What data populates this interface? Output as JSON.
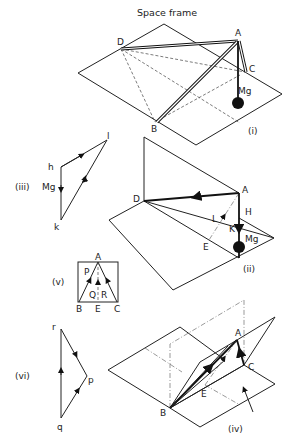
{
  "title": "Space frame",
  "figures": {
    "i": {
      "label": "(i)",
      "points": {
        "A": "A",
        "B": "B",
        "C": "C",
        "D": "D"
      },
      "load": "Mg"
    },
    "ii": {
      "label": "(ii)",
      "points": {
        "A": "A",
        "D": "D",
        "E": "E"
      },
      "forces": {
        "H": "H",
        "K": "K",
        "L": "L"
      },
      "load": "Mg"
    },
    "iii": {
      "label": "(iii)",
      "vertices": {
        "h": "h",
        "k": "k",
        "l": "l"
      },
      "load": "Mg"
    },
    "iv": {
      "label": "(iv)",
      "points": {
        "A": "A",
        "B": "B",
        "C": "C",
        "E": "E"
      }
    },
    "v": {
      "label": "(v)",
      "points": {
        "A": "A",
        "B": "B",
        "C": "C",
        "E": "E"
      },
      "forces": {
        "P": "P",
        "Q": "Q",
        "R": "R"
      }
    },
    "vi": {
      "label": "(vi)",
      "vertices": {
        "p": "p",
        "q": "q",
        "r": "r"
      }
    }
  }
}
